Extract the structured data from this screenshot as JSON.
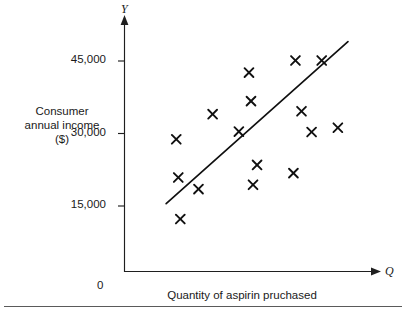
{
  "figure": {
    "y_axis_title": "Consumer\nannual income\n($)",
    "x_axis_title": "Quantity of aspirin pruchased",
    "y_variable_symbol": "Y",
    "x_variable_symbol": "Q",
    "origin_label": "0"
  },
  "chart_data": {
    "type": "scatter",
    "title": "",
    "xlabel": "Quantity of aspirin pruchased",
    "ylabel": "Consumer annual income ($)",
    "x_symbol": "Q",
    "y_symbol": "Y",
    "grid": false,
    "legend": "none",
    "origin_label": "0",
    "y_ticks": [
      15000,
      30000,
      45000
    ],
    "y_tick_labels": [
      "15,000",
      "30,000",
      "45,000"
    ],
    "x_ticks": [],
    "x_tick_labels": [],
    "ylim": [
      0,
      52000
    ],
    "xlim": [
      0,
      100
    ],
    "marker": "x",
    "marker_color": "#101010",
    "line_color": "#101010",
    "points": [
      {
        "x": 13,
        "y": 28800
      },
      {
        "x": 14,
        "y": 20900
      },
      {
        "x": 15,
        "y": 12300
      },
      {
        "x": 24,
        "y": 18500
      },
      {
        "x": 31,
        "y": 34000
      },
      {
        "x": 44,
        "y": 30400
      },
      {
        "x": 49,
        "y": 42600
      },
      {
        "x": 50,
        "y": 36700
      },
      {
        "x": 53,
        "y": 23500
      },
      {
        "x": 51,
        "y": 19400
      },
      {
        "x": 72,
        "y": 45100
      },
      {
        "x": 85,
        "y": 45100
      },
      {
        "x": 75,
        "y": 34600
      },
      {
        "x": 80,
        "y": 30300
      },
      {
        "x": 71,
        "y": 21800
      },
      {
        "x": 93,
        "y": 31200
      }
    ],
    "trend_line": {
      "type": "linear-fit",
      "x_start": 8,
      "y_start": 15500,
      "x_end": 98,
      "y_end": 49000
    }
  }
}
